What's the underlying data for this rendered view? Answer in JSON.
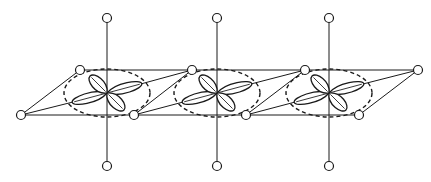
{
  "diagram": {
    "width": 431,
    "height": 182,
    "stroke": "#1a1a1a",
    "atom_radius": 4.5,
    "top_row_y": 70,
    "bottom_row_y": 115,
    "center_y": 93,
    "apex_top_y": 18,
    "apex_bottom_y": 166,
    "units": [
      {
        "cx": 107,
        "top_atom_x": 80,
        "bottom_atom_x": 134
      },
      {
        "cx": 217,
        "top_atom_x": 192,
        "bottom_atom_x": 246
      },
      {
        "cx": 329,
        "top_atom_x": 305,
        "bottom_atom_x": 359
      }
    ],
    "left_atom": {
      "x": 21,
      "y": 115
    },
    "right_atom": {
      "x": 418,
      "y": 70
    },
    "ellipse": {
      "rx": 43,
      "ry": 24
    },
    "orbital": {
      "long_lobe": 36,
      "long_w": 5,
      "short_lobe": 24,
      "short_w": 6,
      "long_angle": -15,
      "short_angle": 45
    }
  }
}
